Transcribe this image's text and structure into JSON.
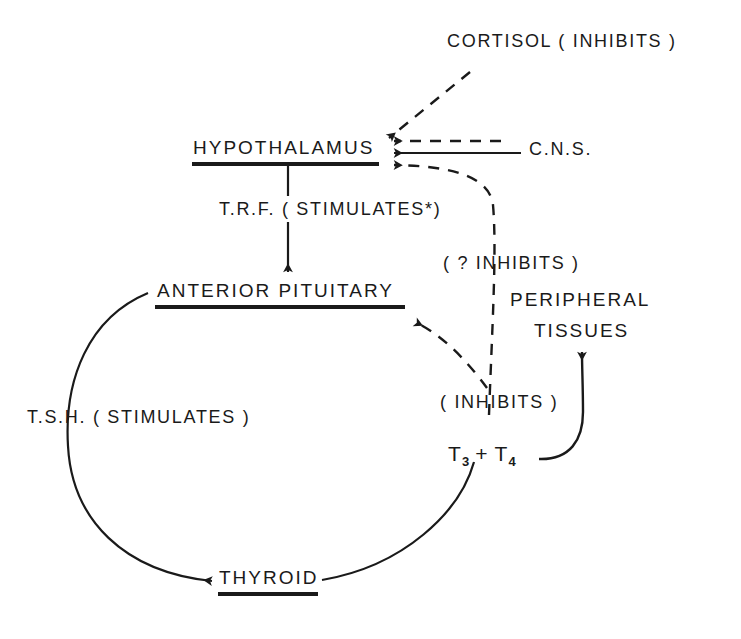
{
  "diagram": {
    "background_color": "#ffffff",
    "ink_color": "#1a1a1a",
    "nodes": {
      "cortisol": "CORTISOL ( INHIBITS )",
      "hypothalamus": "HYPOTHALAMUS",
      "cns": "C.N.S.",
      "trf": "T.R.F. ( STIMULATES*)",
      "question_inhibits": "( ? INHIBITS )",
      "anterior_pituitary": "ANTERIOR PITUITARY",
      "peripheral_line1": "PERIPHERAL",
      "peripheral_line2": "TISSUES",
      "tsh": "T.S.H. ( STIMULATES )",
      "inhibits": "( INHIBITS )",
      "thyroid": "THYROID",
      "t3": "T",
      "t3_sub": "3",
      "plus": "+",
      "t4": "T",
      "t4_sub": "4"
    },
    "edges": [
      {
        "name": "cortisol-to-hypothalamus",
        "style": "dashed",
        "from": "cortisol",
        "to": "hypothalamus"
      },
      {
        "name": "dashed-right-to-hypothalamus",
        "style": "dashed",
        "from": "right",
        "to": "hypothalamus"
      },
      {
        "name": "cns-to-hypothalamus",
        "style": "solid",
        "from": "cns",
        "to": "hypothalamus"
      },
      {
        "name": "t3t4-to-hypothalamus",
        "style": "dashed",
        "from": "t3-t4",
        "to": "hypothalamus"
      },
      {
        "name": "hypothalamus-to-anterior-pituitary",
        "style": "solid",
        "from": "hypothalamus",
        "to": "anterior-pituitary"
      },
      {
        "name": "t3t4-to-anterior-pituitary",
        "style": "dashed",
        "from": "t3-t4",
        "to": "anterior-pituitary"
      },
      {
        "name": "anterior-pituitary-to-thyroid",
        "style": "solid",
        "from": "anterior-pituitary",
        "to": "thyroid"
      },
      {
        "name": "thyroid-to-t3t4",
        "style": "solid",
        "from": "thyroid",
        "to": "t3-t4"
      },
      {
        "name": "t3t4-to-peripheral-tissues",
        "style": "solid",
        "from": "t3-t4",
        "to": "peripheral-tissues"
      }
    ]
  }
}
